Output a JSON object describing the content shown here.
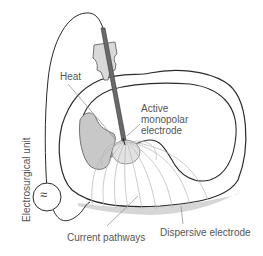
{
  "diagram": {
    "labels": {
      "heat": "Heat",
      "active_electrode_lines": [
        "Active",
        "monopolar",
        "electrode"
      ],
      "current_pathways": "Current pathways",
      "dispersive_electrode": "Dispersive electrode",
      "electrosurgical_unit": "Electrosurgical unit"
    },
    "icons": {
      "generator_symbol": "≈"
    },
    "colors": {
      "outline": "#2a2a2a",
      "label_text": "#555555",
      "leader_line": "#888888",
      "heat_zone_fill": "#c8c8c8",
      "probe_handle_fill": "#d9d9d9",
      "probe_shaft": "#666666",
      "current_lines": "#b5b5b5",
      "dispersive_pad_shadow": "#d0d0d0"
    }
  }
}
